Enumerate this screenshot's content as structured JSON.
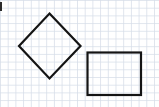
{
  "figure": {
    "canvas": {
      "width": 159,
      "height": 107
    }
  },
  "paper": {
    "name": "graph-paper",
    "background_color": "#ffffff",
    "minor_grid_color": "#e3e8ef",
    "major_grid_color": "#ccd4e0",
    "minor_spacing_px": 7.7,
    "major_every": 1
  },
  "ink": {
    "stroke_color": "#141414",
    "stroke_width_px": 2.2
  },
  "shapes": [
    {
      "name": "diamond",
      "label": "Diamond (rotated square)",
      "type": "polygon",
      "points": "49.5,13.5 80.5,46 49.5,78.5 19,46",
      "vertices": [
        {
          "name": "top",
          "x": 49.5,
          "y": 13.5
        },
        {
          "name": "right",
          "x": 80.5,
          "y": 46
        },
        {
          "name": "bottom",
          "x": 49.5,
          "y": 78.5
        },
        {
          "name": "left",
          "x": 19,
          "y": 46
        }
      ],
      "width_px": 61.5,
      "height_px": 65
    },
    {
      "name": "rectangle",
      "label": "Rectangle",
      "type": "rect",
      "x": 87.5,
      "y": 52.5,
      "width": 53.5,
      "height": 42.5,
      "vertices": [
        {
          "name": "top-left",
          "x": 87.5,
          "y": 52.5
        },
        {
          "name": "top-right",
          "x": 141,
          "y": 52.5
        },
        {
          "name": "bottom-right",
          "x": 141,
          "y": 95
        },
        {
          "name": "bottom-left",
          "x": 87.5,
          "y": 95
        }
      ]
    }
  ],
  "edge_mark": {
    "name": "left-edge-mark",
    "x": 0,
    "y": 2,
    "width": 2,
    "height": 9,
    "color": "#2b2b2b"
  }
}
